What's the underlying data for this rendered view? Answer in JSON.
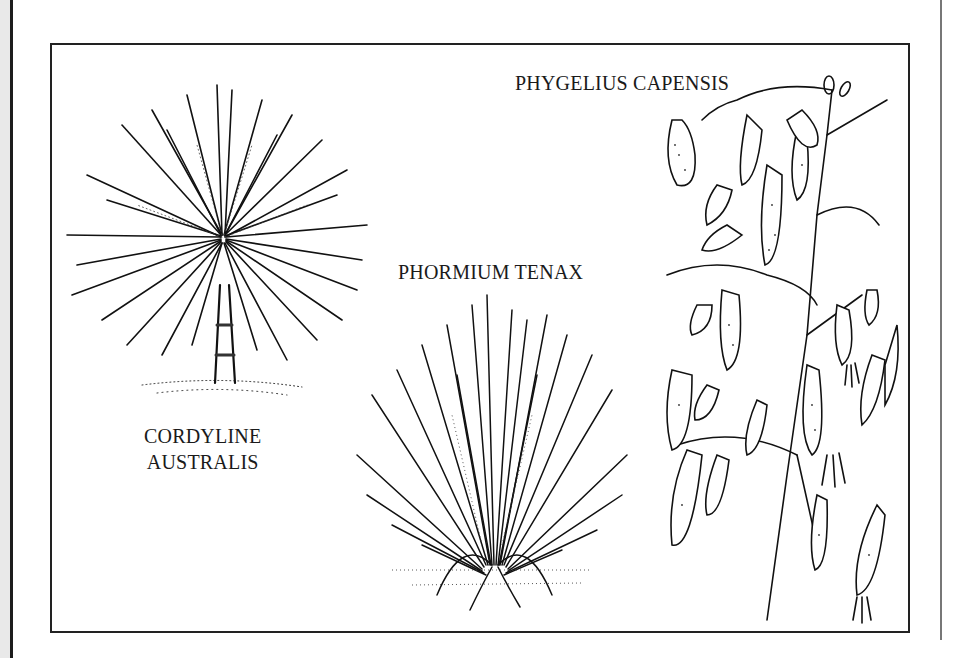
{
  "page": {
    "colors": {
      "background": "#ffffff",
      "ink": "#1a1a1a",
      "frame": "#222222",
      "left_strip": "#e9e9e9",
      "right_rule": "#777777"
    }
  },
  "illustration": {
    "plants": [
      {
        "id": "cordyline",
        "caption_lines": [
          "CORDYLINE",
          "AUSTRALIS"
        ]
      },
      {
        "id": "phormium",
        "caption_lines": [
          "PHORMIUM TENAX"
        ]
      },
      {
        "id": "phygelius",
        "caption_lines": [
          "PHYGELIUS CAPENSIS"
        ]
      }
    ]
  }
}
